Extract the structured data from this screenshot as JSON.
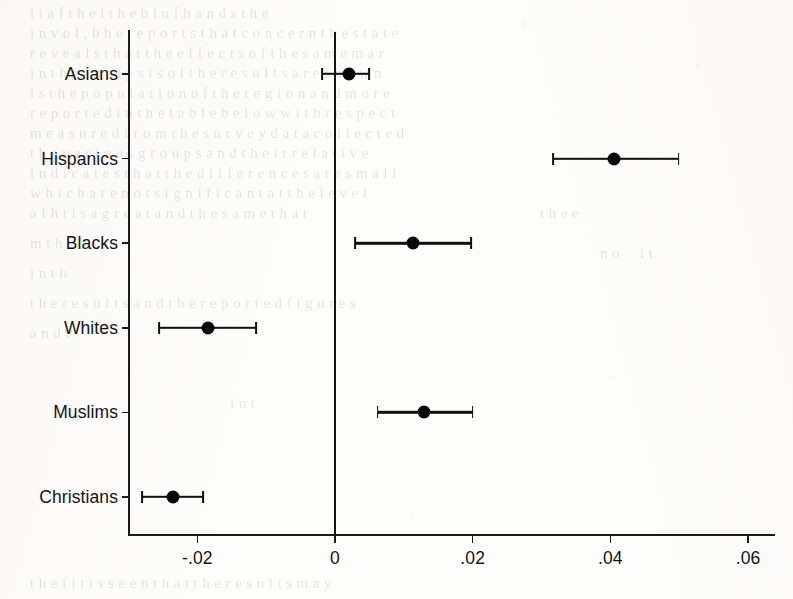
{
  "figure": {
    "kind": "coefficient-plot",
    "background_note": "scanned book page with faint bleed-through text"
  },
  "chart_data": {
    "type": "scatter",
    "subtype": "coefficient-plot-with-confidence-intervals",
    "title": "",
    "xlabel": "",
    "ylabel": "",
    "orientation": "horizontal",
    "grid": false,
    "legend": null,
    "zero_reference_line": 0,
    "xlim": [
      -0.0285,
      0.064
    ],
    "xticks": [
      -0.02,
      0,
      0.02,
      0.04,
      0.06
    ],
    "xticklabels": [
      "-.02",
      "0",
      ".02",
      ".04",
      ".06"
    ],
    "categories": [
      "Asians",
      "Hispanics",
      "Blacks",
      "Whites",
      "Muslims",
      "Christians"
    ],
    "values": [
      0.002,
      0.0405,
      0.0113,
      -0.0184,
      0.0129,
      -0.0235
    ],
    "ci_low": [
      -0.0019,
      0.0317,
      0.0029,
      -0.0256,
      0.0062,
      -0.028
    ],
    "ci_high": [
      0.0049,
      0.0499,
      0.0198,
      -0.0115,
      0.02,
      -0.0192
    ],
    "points": [
      {
        "category": "Asians",
        "value": 0.002,
        "ci_low": -0.0019,
        "ci_high": 0.0049
      },
      {
        "category": "Hispanics",
        "value": 0.0405,
        "ci_low": 0.0317,
        "ci_high": 0.0499
      },
      {
        "category": "Blacks",
        "value": 0.0113,
        "ci_low": 0.0029,
        "ci_high": 0.0198
      },
      {
        "category": "Whites",
        "value": -0.0184,
        "ci_low": -0.0256,
        "ci_high": -0.0115
      },
      {
        "category": "Muslims",
        "value": 0.0129,
        "ci_low": 0.0062,
        "ci_high": 0.02
      },
      {
        "category": "Christians",
        "value": -0.0235,
        "ci_low": -0.028,
        "ci_high": -0.0192
      }
    ],
    "marker_color": "#080808",
    "line_color": "#101010",
    "axis_color": "#1b1b1b"
  },
  "ghost_text": [
    {
      "x": 30,
      "y": 6,
      "text": "i  i   a  f  t h e   i    t h e   b    i   u   f   h a n d s   t h e",
      "size": 15
    },
    {
      "x": 30,
      "y": 26,
      "text": "i n v o l  ,  b  h e   r e p o r t s   t h a t   c o n c e r n   t h e   s t a t e",
      "size": 15
    },
    {
      "x": 30,
      "y": 46,
      "text": "r e v e a l s   t h a t   t h e   e f f e c t s   o f   t h e   s a m e   m a r",
      "size": 15
    },
    {
      "x": 30,
      "y": 66,
      "text": "i n   t h e   a n a l y s i s   o f   t h e   r e s u l t s   a r e   s h o w n",
      "size": 15
    },
    {
      "x": 30,
      "y": 86,
      "text": "i s   t h e   p o p u l a t i o n   o f   t h e   r e g i o n   a n d   m o r e",
      "size": 15
    },
    {
      "x": 30,
      "y": 106,
      "text": "r e p o r t e d   i n   t h e   t a b l e   b e l o w   w i t h   r e s p e c t",
      "size": 15
    },
    {
      "x": 30,
      "y": 126,
      "text": "m e a s u r e d   f r o m   t h e   s u r v e y   d a t a   c o l l e c t e d",
      "size": 15
    },
    {
      "x": 30,
      "y": 146,
      "text": "t h e   v a r i o u s   g r o u p s   a n d   t h e i r   r e l a t i v e",
      "size": 15
    },
    {
      "x": 30,
      "y": 166,
      "text": "i n d i c a t e s   t h a t   t h e   d i f f e r e n c e s   a r e   s m a l l",
      "size": 15
    },
    {
      "x": 30,
      "y": 186,
      "text": "w h i c h   a r e   n o t   s i g n i f i c a n t   a t   t h e   l e v e l",
      "size": 15
    },
    {
      "x": 30,
      "y": 206,
      "text": "a   f   h  t   i s   a   g r e a t   a n d   t h e   s a m e   t h a t",
      "size": 15
    },
    {
      "x": 30,
      "y": 236,
      "text": "m   t h   i",
      "size": 15
    },
    {
      "x": 30,
      "y": 266,
      "text": "i n   t h",
      "size": 15
    },
    {
      "x": 30,
      "y": 296,
      "text": "t h e   r e s u l t s   a n d   t h e   r e p o r t e d   f i g u r e s",
      "size": 15
    },
    {
      "x": 30,
      "y": 326,
      "text": "a n d   t",
      "size": 15
    },
    {
      "x": 540,
      "y": 206,
      "text": "t h e   e",
      "size": 15
    },
    {
      "x": 600,
      "y": 246,
      "text": "n   o",
      "size": 15
    },
    {
      "x": 230,
      "y": 396,
      "text": "i n   t",
      "size": 15
    },
    {
      "x": 640,
      "y": 246,
      "text": "i   t",
      "size": 15
    },
    {
      "x": 30,
      "y": 576,
      "text": "t h e   f   i  t   i s   s e e n   t h a t   t h e   r e s u l t s   m a y",
      "size": 15
    }
  ],
  "layout": {
    "plot_left_px": 128,
    "plot_right_px": 775,
    "plot_top_px": 30,
    "plot_bottom_px": 534,
    "zero_x_px": 335,
    "px_per_unit": 6885
  }
}
